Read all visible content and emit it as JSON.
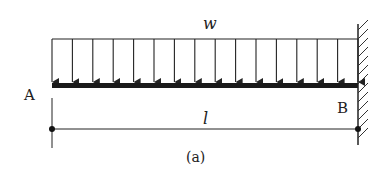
{
  "figure": {
    "caption": "(a)",
    "load_label": "w",
    "length_label": "l",
    "left_point_label": "A",
    "right_point_label": "B",
    "load_type": "uniformly-distributed-load",
    "support_right": "fixed-wall",
    "arrow_count": 16,
    "colors": {
      "ink": "#222222",
      "background": "#ffffff"
    }
  }
}
